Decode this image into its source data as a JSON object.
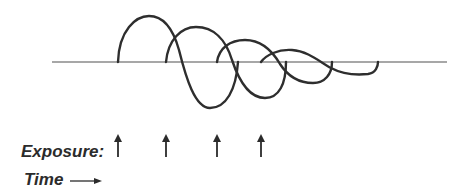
{
  "labels": {
    "exposure": "Exposure:",
    "time": "Time"
  },
  "icons": {
    "exposure_marker": "up-arrow-icon",
    "time_direction": "right-arrow-icon"
  },
  "exposure_arrows_x": [
    118,
    166,
    217,
    261
  ],
  "colors": {
    "curve": "#2e2e2e",
    "baseline": "#8a8a8a",
    "text": "#2b2b2b"
  }
}
